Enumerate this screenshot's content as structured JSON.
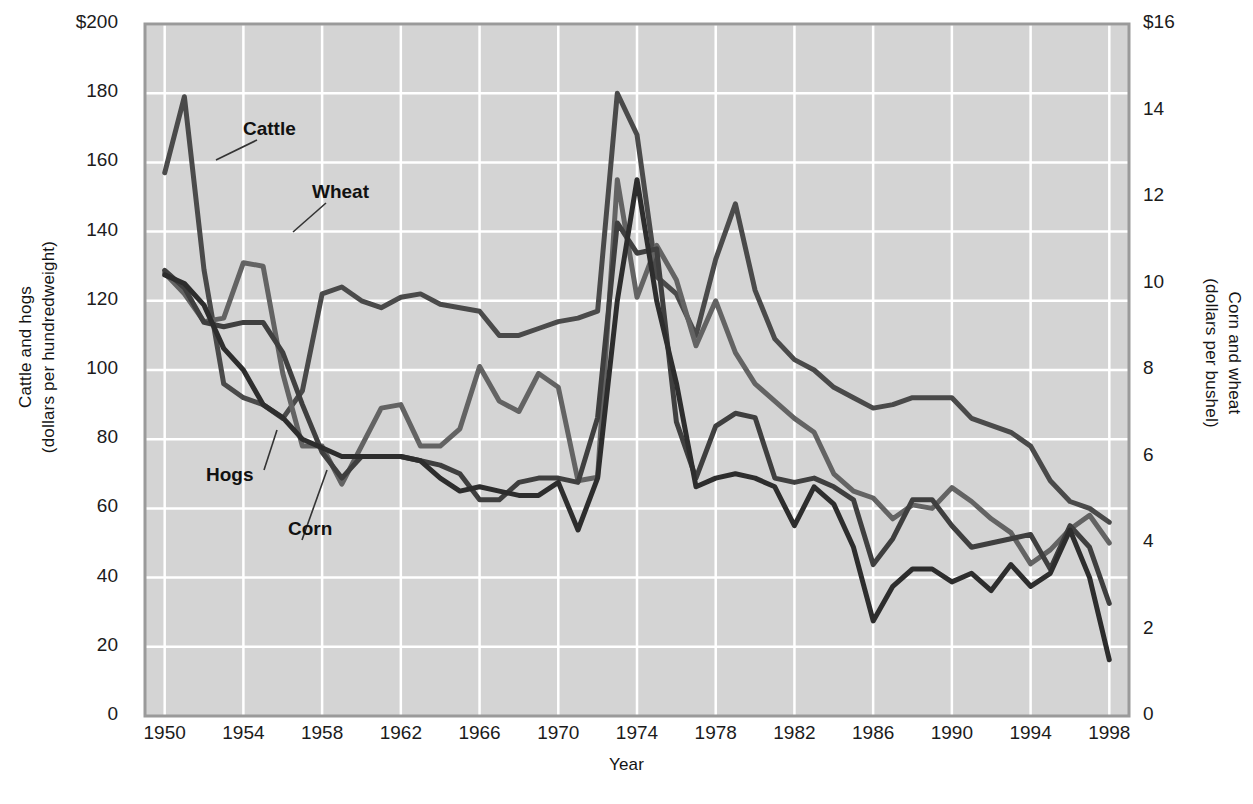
{
  "chart_data": {
    "type": "line",
    "title": "",
    "xlabel": "Year",
    "ylabel_left": "Cattle and hogs\n(dollars per hundredweight)",
    "ylabel_right": "Corn and wheat\n(dollars per bushel)",
    "grid": true,
    "legend_position": "inline-annotations",
    "xlim": [
      1949,
      1999
    ],
    "ylim_left": [
      0,
      200
    ],
    "ylim_right": [
      0,
      16
    ],
    "xticks": [
      "1950",
      "1954",
      "1958",
      "1962",
      "1966",
      "1970",
      "1974",
      "1978",
      "1982",
      "1986",
      "1990",
      "1994",
      "1998"
    ],
    "yticks_left": [
      "$200",
      "180",
      "160",
      "140",
      "120",
      "100",
      "80",
      "60",
      "40",
      "20",
      "0"
    ],
    "yticks_right": [
      "$16",
      "14",
      "12",
      "10",
      "8",
      "6",
      "4",
      "2",
      "0"
    ],
    "x": [
      1950,
      1951,
      1952,
      1953,
      1954,
      1955,
      1956,
      1957,
      1958,
      1959,
      1960,
      1961,
      1962,
      1963,
      1964,
      1965,
      1966,
      1967,
      1968,
      1969,
      1970,
      1971,
      1972,
      1973,
      1974,
      1975,
      1976,
      1977,
      1978,
      1979,
      1980,
      1981,
      1982,
      1983,
      1984,
      1985,
      1986,
      1987,
      1988,
      1989,
      1990,
      1991,
      1992,
      1993,
      1994,
      1995,
      1996,
      1997,
      1998
    ],
    "series": [
      {
        "name": "Cattle",
        "axis": "left",
        "units": "dollars per hundredweight",
        "color": "#4a4a4a",
        "values": [
          157,
          179,
          129,
          96,
          92,
          90,
          86,
          94,
          122,
          124,
          120,
          118,
          121,
          122,
          119,
          118,
          117,
          110,
          110,
          112,
          114,
          115,
          117,
          180,
          168,
          127,
          122,
          110,
          132,
          148,
          123,
          109,
          103,
          100,
          95,
          92,
          89,
          90,
          92,
          92,
          92,
          86,
          84,
          82,
          78,
          68,
          62,
          60,
          56
        ]
      },
      {
        "name": "Hogs",
        "axis": "left",
        "units": "dollars per hundredweight",
        "color": "#636363",
        "values": [
          128,
          122,
          114,
          115,
          131,
          130,
          99,
          78,
          78,
          67,
          78,
          89,
          90,
          78,
          78,
          83,
          101,
          91,
          88,
          99,
          95,
          68,
          69,
          155,
          121,
          136,
          126,
          107,
          120,
          105,
          96,
          91,
          86,
          82,
          70,
          65,
          63,
          57,
          61,
          60,
          66,
          62,
          57,
          53,
          44,
          48,
          54,
          58,
          50
        ]
      },
      {
        "name": "Wheat",
        "axis": "right",
        "units": "dollars per bushel",
        "color": "#3f3f3f",
        "values": [
          10.3,
          9.9,
          9.1,
          9.0,
          9.1,
          9.1,
          8.4,
          7.2,
          6.1,
          5.5,
          6.0,
          6.0,
          6.0,
          5.9,
          5.8,
          5.6,
          5.0,
          5.0,
          5.4,
          5.5,
          5.5,
          5.4,
          6.9,
          11.4,
          10.7,
          10.8,
          6.8,
          5.5,
          6.7,
          7.0,
          6.9,
          5.5,
          5.4,
          5.5,
          5.3,
          5.0,
          3.5,
          4.1,
          5.0,
          5.0,
          4.4,
          3.9,
          4.0,
          4.1,
          4.2,
          3.4,
          4.4,
          3.9,
          2.6
        ]
      },
      {
        "name": "Corn",
        "axis": "right",
        "units": "dollars per bushel",
        "color": "#2d2d2d",
        "values": [
          10.2,
          10.0,
          9.5,
          8.5,
          8.0,
          7.2,
          6.9,
          6.4,
          6.2,
          6.0,
          6.0,
          6.0,
          6.0,
          5.9,
          5.5,
          5.2,
          5.3,
          5.2,
          5.1,
          5.1,
          5.4,
          4.3,
          5.5,
          9.6,
          12.4,
          9.6,
          7.7,
          5.3,
          5.5,
          5.6,
          5.5,
          5.3,
          4.4,
          5.3,
          4.9,
          3.9,
          2.2,
          3.0,
          3.4,
          3.4,
          3.1,
          3.3,
          2.9,
          3.5,
          3.0,
          3.3,
          4.3,
          3.2,
          1.3
        ]
      }
    ],
    "annotations": [
      {
        "label": "Cattle",
        "target_year": 1951
      },
      {
        "label": "Wheat",
        "target_year": 1956
      },
      {
        "label": "Hogs",
        "target_year": 1958
      },
      {
        "label": "Corn",
        "target_year": 1960
      }
    ]
  },
  "colors": {
    "plot_background": "#d4d4d4",
    "gridline": "#ffffff",
    "axis_border": "#9a9a9a",
    "text": "#1b1b1b"
  }
}
